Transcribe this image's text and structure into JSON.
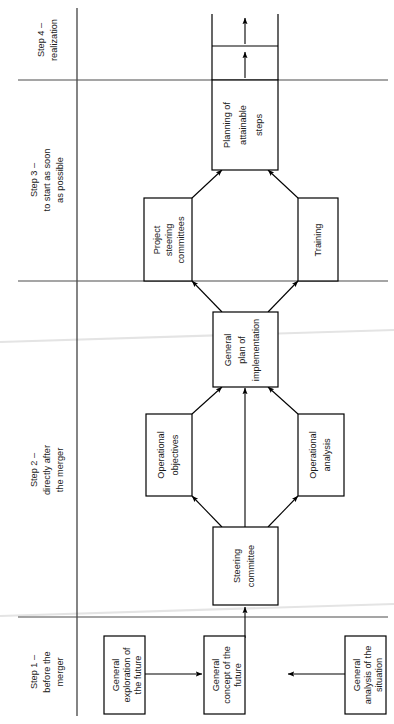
{
  "page": {
    "orientation": "rotated-90-ccw",
    "background_color": "#ffffff",
    "line_color": "#000000",
    "divider_color": "#4d4d4d"
  },
  "steps": [
    {
      "id": "step-4",
      "label_line1": "Step 4 –",
      "label_line2": "realization",
      "label_line3": ""
    },
    {
      "id": "step-3",
      "label_line1": "Step 3 –",
      "label_line2": "to start as soon",
      "label_line3": "as possible"
    },
    {
      "id": "step-2",
      "label_line1": "Step 2 –",
      "label_line2": "directly after",
      "label_line3": "the merger"
    },
    {
      "id": "step-1",
      "label_line1": "Step 1 –",
      "label_line2": "before the",
      "label_line3": "merger"
    }
  ],
  "boxes": [
    {
      "id": "general-exploration-of-the-future",
      "lines": [
        "General",
        "exploration of",
        "the future"
      ],
      "step": "step-1"
    },
    {
      "id": "general-concept-of-the-future",
      "lines": [
        "General",
        "concept of the",
        "future"
      ],
      "step": "step-1"
    },
    {
      "id": "general-analysis-of-the-situation",
      "lines": [
        "General",
        "analysis of the",
        "situation"
      ],
      "step": "step-1"
    },
    {
      "id": "steering-committee",
      "lines": [
        "Steering",
        "committee"
      ],
      "step": "step-2"
    },
    {
      "id": "operational-objectives",
      "lines": [
        "Operational",
        "objectives"
      ],
      "step": "step-2"
    },
    {
      "id": "operational-analysis",
      "lines": [
        "Operational",
        "analysis"
      ],
      "step": "step-2"
    },
    {
      "id": "general-plan-of-implementation",
      "lines": [
        "General",
        "plan of",
        "implementation"
      ],
      "step": "step-2"
    },
    {
      "id": "project-steering-committees",
      "lines": [
        "Project",
        "steering",
        "committees"
      ],
      "step": "step-3"
    },
    {
      "id": "training",
      "lines": [
        "Training"
      ],
      "step": "step-3"
    },
    {
      "id": "planning-of-attainable-steps",
      "lines": [
        "Planning of",
        "attainable",
        "steps"
      ],
      "step": "step-3"
    },
    {
      "id": "realization-stage-1",
      "lines": [],
      "step": "step-4"
    },
    {
      "id": "realization-stage-2",
      "lines": [],
      "step": "step-4"
    }
  ],
  "connections": [
    {
      "from": "general-exploration-of-the-future",
      "to": "general-concept-of-the-future"
    },
    {
      "from": "general-analysis-of-the-situation",
      "to": "general-concept-of-the-future"
    },
    {
      "from": "general-concept-of-the-future",
      "to": "steering-committee"
    },
    {
      "from": "steering-committee",
      "to": "operational-objectives"
    },
    {
      "from": "steering-committee",
      "to": "operational-analysis"
    },
    {
      "from": "steering-committee",
      "to": "general-plan-of-implementation"
    },
    {
      "from": "operational-objectives",
      "to": "general-plan-of-implementation"
    },
    {
      "from": "operational-analysis",
      "to": "general-plan-of-implementation"
    },
    {
      "from": "general-plan-of-implementation",
      "to": "project-steering-committees"
    },
    {
      "from": "general-plan-of-implementation",
      "to": "training"
    },
    {
      "from": "project-steering-committees",
      "to": "planning-of-attainable-steps"
    },
    {
      "from": "training",
      "to": "planning-of-attainable-steps"
    },
    {
      "from": "planning-of-attainable-steps",
      "to": "realization-stage-1"
    },
    {
      "from": "realization-stage-1",
      "to": "realization-stage-2"
    }
  ]
}
